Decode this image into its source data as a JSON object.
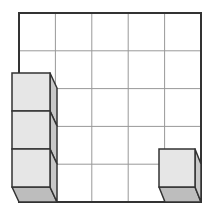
{
  "diagram": {
    "grid": {
      "rows": 5,
      "cols": 5,
      "x0": 19,
      "y0": 13,
      "x1": 201,
      "y1": 202,
      "border_color": "#333333",
      "line_color": "#999999"
    },
    "left_stack": {
      "cube_count": 3,
      "front_x": 12,
      "front_w": 38,
      "top_y": 73,
      "cube_h": 38,
      "depth_dx": 7,
      "depth_dy": 15
    },
    "right_cube": {
      "cube_count": 1,
      "front_x": 159,
      "front_w": 36,
      "top_y": 149,
      "cube_h": 38,
      "depth_dx": 6,
      "depth_dy": 15
    },
    "colors": {
      "front_face": "#e6e6e6",
      "side_face": "#c8c8c8",
      "bottom_face": "#bdbdbd",
      "edge": "#333333"
    }
  }
}
